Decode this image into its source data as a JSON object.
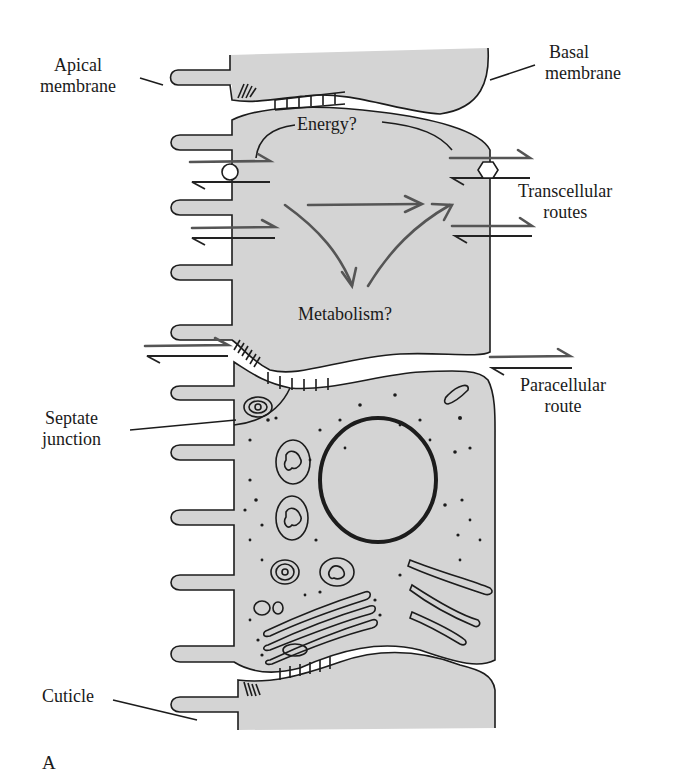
{
  "figure": {
    "panel_label": "A",
    "colors": {
      "cytoplasm": "#d4d4d4",
      "outline": "#1c1c1c",
      "route_arrow": "#555555",
      "background": "#ffffff"
    }
  },
  "labels": {
    "apical_membrane": [
      "Apical",
      "membrane"
    ],
    "basal_membrane": [
      "Basal",
      "membrane"
    ],
    "energy": "Energy?",
    "metabolism": "Metabolism?",
    "transcellular_routes": [
      "Transcellular",
      "routes"
    ],
    "paracellular_route": [
      "Paracellular",
      "route"
    ],
    "septate_junction": [
      "Septate",
      "junction"
    ],
    "cuticle": "Cuticle"
  }
}
